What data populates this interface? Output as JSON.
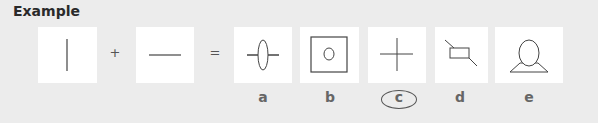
{
  "title": "Example",
  "operators": {
    "plus": "+",
    "equals": "="
  },
  "inputs": [
    {
      "name": "vertical-line"
    },
    {
      "name": "horizontal-line"
    }
  ],
  "options": [
    {
      "label": "a",
      "figure": "horizontal-line-through-vertical-ellipse",
      "selected": false
    },
    {
      "label": "b",
      "figure": "small-circle-in-square",
      "selected": false
    },
    {
      "label": "c",
      "figure": "plus-cross",
      "selected": true
    },
    {
      "label": "d",
      "figure": "diagonal-line-through-rectangle",
      "selected": false
    },
    {
      "label": "e",
      "figure": "ellipse-on-trapezoid",
      "selected": false
    }
  ],
  "colors": {
    "background": "#ececec",
    "box": "#ffffff",
    "stroke": "#444444"
  }
}
